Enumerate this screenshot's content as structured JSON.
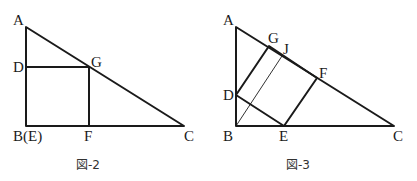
{
  "figures": [
    {
      "caption": "図-2",
      "labels": {
        "A": "A",
        "D": "D",
        "G": "G",
        "B": "B(E)",
        "F": "F",
        "C": "C"
      },
      "points": {
        "A": [
          26,
          27
        ],
        "B": [
          26,
          126
        ],
        "C": [
          184,
          126
        ],
        "D": [
          26,
          67
        ],
        "G": [
          89,
          67
        ],
        "F": [
          89,
          126
        ]
      }
    },
    {
      "caption": "図-3",
      "labels": {
        "A": "A",
        "G": "G",
        "J": "J",
        "F": "F",
        "D": "D",
        "B": "B",
        "E": "E",
        "C": "C"
      },
      "points": {
        "A": [
          236,
          27
        ],
        "B": [
          236,
          126
        ],
        "C": [
          394,
          126
        ],
        "G": [
          269,
          46
        ],
        "J": [
          282,
          56
        ],
        "F": [
          317,
          78
        ],
        "D": [
          236,
          95
        ],
        "E": [
          284,
          126
        ]
      }
    }
  ],
  "colors": {
    "line": "#1a1a1a",
    "background": "#ffffff"
  }
}
